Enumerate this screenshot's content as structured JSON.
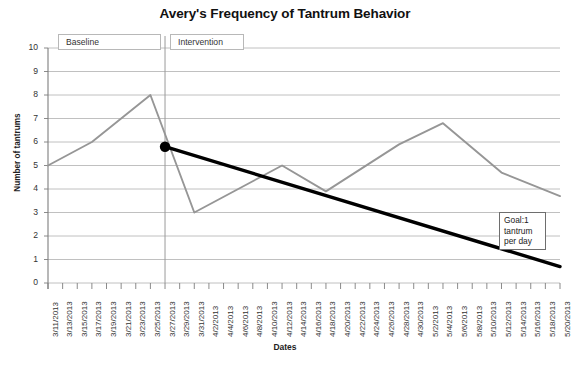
{
  "chart_data": {
    "type": "line",
    "title": "Avery's Frequency of Tantrum Behavior",
    "xlabel": "Dates",
    "ylabel": "Number of tantrums",
    "ylim": [
      0,
      10
    ],
    "ytick_labels": [
      "10",
      "9",
      "8",
      "7",
      "6",
      "5",
      "4",
      "3",
      "2",
      "1",
      "0"
    ],
    "grid": true,
    "legend": "none",
    "categories": [
      "3/11/2013",
      "3/13/2013",
      "3/15/2013",
      "3/17/2013",
      "3/19/2013",
      "3/21/2013",
      "3/23/2013",
      "3/25/2013",
      "3/27/2013",
      "3/29/2013",
      "3/31/2013",
      "4/2/2013",
      "4/4/2013",
      "4/6/2013",
      "4/8/2013",
      "4/10/2013",
      "4/12/2013",
      "4/14/2013",
      "4/16/2013",
      "4/18/2013",
      "4/20/2013",
      "4/22/2013",
      "4/24/2013",
      "4/26/2013",
      "4/28/2013",
      "4/30/2013",
      "5/2/2013",
      "5/4/2013",
      "5/6/2013",
      "5/8/2013",
      "5/10/2013",
      "5/12/2013",
      "5/14/2013",
      "5/16/2013",
      "5/18/2013",
      "5/20/2013"
    ],
    "series": [
      {
        "name": "Tantrum frequency",
        "color": "#969696",
        "points": [
          {
            "x": "3/11/2013",
            "y": 5.0
          },
          {
            "x": "3/17/2013",
            "y": 6.0
          },
          {
            "x": "3/25/2013",
            "y": 8.0
          },
          {
            "x": "3/31/2013",
            "y": 3.0
          },
          {
            "x": "4/12/2013",
            "y": 5.0
          },
          {
            "x": "4/18/2013",
            "y": 3.9
          },
          {
            "x": "4/28/2013",
            "y": 5.9
          },
          {
            "x": "5/4/2013",
            "y": 6.8
          },
          {
            "x": "5/12/2013",
            "y": 4.7
          },
          {
            "x": "5/20/2013",
            "y": 3.7
          }
        ]
      },
      {
        "name": "Goal trend line",
        "color": "#000000",
        "points": [
          {
            "x": "3/27/2013",
            "y": 5.8
          },
          {
            "x": "5/20/2013",
            "y": 0.7
          }
        ],
        "marker": {
          "at": "3/27/2013",
          "y": 5.8,
          "shape": "circle"
        }
      }
    ],
    "phase_line": {
      "at": "3/27/2013",
      "color": "#9a9a9a"
    },
    "annotations": [
      {
        "name": "baseline-phase-label",
        "text": "Baseline"
      },
      {
        "name": "intervention-phase-label",
        "text": "Intervention"
      },
      {
        "name": "goal-annotation",
        "text": "Goal:1 tantrum per day"
      }
    ]
  },
  "colors": {
    "data_line": "#969696",
    "trend_line": "#000000",
    "gridline": "#b9b9b9",
    "axis": "#7e7e7e",
    "phase_divider": "#9a9a9a"
  }
}
